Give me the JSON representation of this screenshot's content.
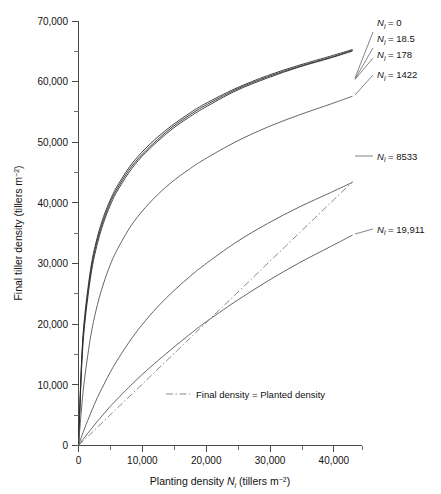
{
  "chart_data": {
    "type": "line",
    "title": "",
    "xlabel": "Planting density Ni (tillers m-2)",
    "xlabel_main": "Planting density",
    "xlabel_symbol": "N",
    "xlabel_sub": "i",
    "xlabel_units": "(tillers m",
    "xlabel_exp": "−2",
    "xlabel_close": ")",
    "ylabel": "Final tiller density (tillers m-2)",
    "ylabel_main": "Final tiller density (tillers m",
    "ylabel_exp": "−2",
    "ylabel_close": ")",
    "xlim": [
      0,
      45000
    ],
    "ylim": [
      0,
      70000
    ],
    "grid": false,
    "legend_position": "right-inline-leaders",
    "x_ticks_major": [
      0,
      10000,
      20000,
      30000,
      40000
    ],
    "x_ticklabels": [
      "0",
      "10,000",
      "20,000",
      "30,000",
      "40,000"
    ],
    "x_ticks_minor": [
      5000,
      15000,
      25000,
      35000,
      45000
    ],
    "y_ticks_major": [
      0,
      10000,
      20000,
      30000,
      40000,
      50000,
      60000,
      70000
    ],
    "y_ticklabels": [
      "0",
      "10,000",
      "20,000",
      "30,000",
      "40,000",
      "50,000",
      "60,000",
      "70,000"
    ],
    "y_ticks_minor": [
      5000,
      15000,
      25000,
      35000,
      45000,
      55000,
      65000
    ],
    "x": [
      0,
      500,
      1000,
      2000,
      3000,
      4000,
      5000,
      6000,
      8000,
      10000,
      12500,
      15000,
      17500,
      20000,
      25000,
      30000,
      35000,
      40000,
      43500
    ],
    "series": [
      {
        "name": "Nj = 0",
        "label_symbol": "N",
        "label_sub": "i",
        "label_value": "= 0",
        "label_text": "Ni = 0",
        "style": "solid",
        "color": "#2b2b2b",
        "values": [
          0,
          14200,
          21500,
          29600,
          34400,
          37800,
          40400,
          42500,
          45800,
          48300,
          50800,
          52900,
          54700,
          56300,
          58900,
          61000,
          62700,
          64200,
          65300
        ]
      },
      {
        "name": "Nj = 18.5",
        "label_symbol": "N",
        "label_sub": "i",
        "label_value": "= 18.5",
        "label_text": "Ni = 18.5",
        "style": "solid",
        "color": "#3a3a3a",
        "values": [
          0,
          13700,
          20900,
          29000,
          33900,
          37300,
          40000,
          42100,
          45400,
          47900,
          50400,
          52600,
          54400,
          56000,
          58700,
          60800,
          62500,
          64000,
          65150
        ]
      },
      {
        "name": "Nj = 178",
        "label_symbol": "N",
        "label_sub": "i",
        "label_value": "= 178",
        "label_text": "Ni = 178",
        "style": "solid",
        "color": "#4a4a4a",
        "values": [
          0,
          12900,
          20100,
          28300,
          33300,
          36800,
          39500,
          41700,
          45000,
          47600,
          50100,
          52300,
          54100,
          55700,
          58500,
          60600,
          62400,
          63900,
          65050
        ]
      },
      {
        "name": "Nj = 1422",
        "label_symbol": "N",
        "label_sub": "i",
        "label_value": "= 1422",
        "label_text": "Ni = 1422",
        "style": "solid",
        "color": "#555555",
        "values": [
          0,
          6300,
          11300,
          18400,
          23200,
          26800,
          29700,
          32000,
          35700,
          38500,
          41300,
          43600,
          45500,
          47200,
          50100,
          52500,
          54500,
          56300,
          57600
        ]
      },
      {
        "name": "Nj = 8533",
        "label_symbol": "N",
        "label_sub": "i",
        "label_value": "= 8533",
        "label_text": "Ni = 8533",
        "style": "solid",
        "color": "#555555",
        "values": [
          0,
          1500,
          2900,
          5500,
          7900,
          10000,
          12000,
          13800,
          17000,
          19800,
          22800,
          25400,
          27700,
          29800,
          33500,
          36600,
          39300,
          41700,
          43400
        ]
      },
      {
        "name": "Nj = 19,911",
        "label_symbol": "N",
        "label_sub": "i",
        "label_value": "= 19,911",
        "label_text": "Ni = 19,911",
        "style": "solid",
        "color": "#555555",
        "values": [
          0,
          700,
          1400,
          2700,
          4000,
          5200,
          6400,
          7500,
          9600,
          11600,
          13900,
          16100,
          18200,
          20200,
          23800,
          27100,
          30100,
          32800,
          34700
        ]
      }
    ],
    "reference_line": {
      "label": "Final density = Planted density",
      "style": "dash-dot",
      "color": "#7d7d7d",
      "x": [
        0,
        43500
      ],
      "y": [
        0,
        43500
      ]
    },
    "annotations": [
      "Final density = Planted density"
    ]
  }
}
